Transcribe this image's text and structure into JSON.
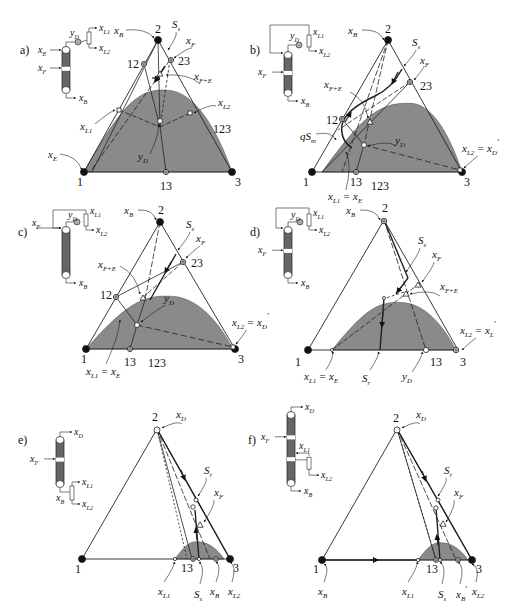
{
  "figure": {
    "panels": [
      {
        "id": "a",
        "label": "a)",
        "vertices": {
          "v1": "1",
          "v2": "2",
          "v3": "3"
        },
        "points": {
          "p12": "12",
          "p23": "23",
          "p13": "13",
          "p123": "123"
        },
        "annotations": [
          {
            "key": "xB",
            "base": "x",
            "sub": "B"
          },
          {
            "key": "Ss",
            "base": "S",
            "sub": "s"
          },
          {
            "key": "xF",
            "base": "x",
            "sub": "F"
          },
          {
            "key": "xFE",
            "base": "x",
            "sub": "F+E"
          },
          {
            "key": "xL2",
            "base": "x",
            "sub": "L2"
          },
          {
            "key": "xL1",
            "base": "x",
            "sub": "L1"
          },
          {
            "key": "yD",
            "base": "y",
            "sub": "D"
          },
          {
            "key": "xE",
            "base": "x",
            "sub": "E"
          }
        ],
        "column": {
          "streams": [
            {
              "key": "yD",
              "base": "y",
              "sub": "D"
            },
            {
              "key": "xL1",
              "base": "x",
              "sub": "L1"
            },
            {
              "key": "xL2",
              "base": "x",
              "sub": "L2"
            },
            {
              "key": "xE",
              "base": "x",
              "sub": "E"
            },
            {
              "key": "xF",
              "base": "x",
              "sub": "F"
            },
            {
              "key": "xB",
              "base": "x",
              "sub": "B"
            }
          ]
        }
      },
      {
        "id": "b",
        "label": "b)",
        "vertices": {
          "v1": "1",
          "v2": "2",
          "v3": "3"
        },
        "points": {
          "p12": "12",
          "p23": "23",
          "p13": "13",
          "p123": "123"
        },
        "annotations": [
          {
            "key": "xB",
            "base": "x",
            "sub": "B"
          },
          {
            "key": "Ss",
            "base": "S",
            "sub": "s"
          },
          {
            "key": "xF",
            "base": "x",
            "sub": "F"
          },
          {
            "key": "xFE",
            "base": "x",
            "sub": "F+E"
          },
          {
            "key": "qSm",
            "base": "qS",
            "sub": "m"
          },
          {
            "key": "yD",
            "base": "y",
            "sub": "D"
          },
          {
            "key": "xL1E",
            "base": "x",
            "sub": "L1",
            "suffix": " = x",
            "suffix_sub": "E"
          },
          {
            "key": "xL2D",
            "base": "x",
            "sub": "L2",
            "suffix": " = x",
            "suffix_sub": "D",
            "prime": "'"
          }
        ],
        "column": {
          "streams": [
            {
              "key": "yD",
              "base": "y",
              "sub": "D"
            },
            {
              "key": "xL1",
              "base": "x",
              "sub": "L1"
            },
            {
              "key": "xL2",
              "base": "x",
              "sub": "L2"
            },
            {
              "key": "xF",
              "base": "x",
              "sub": "F"
            },
            {
              "key": "xB",
              "base": "x",
              "sub": "B"
            }
          ]
        }
      },
      {
        "id": "c",
        "label": "c)",
        "vertices": {
          "v1": "1",
          "v2": "2",
          "v3": "3"
        },
        "points": {
          "p12": "12",
          "p23": "23",
          "p13": "13",
          "p123": "123"
        },
        "annotations": [
          {
            "key": "xB",
            "base": "x",
            "sub": "B"
          },
          {
            "key": "Ss",
            "base": "S",
            "sub": "s"
          },
          {
            "key": "xF",
            "base": "x",
            "sub": "F"
          },
          {
            "key": "xFE",
            "base": "x",
            "sub": "F+E"
          },
          {
            "key": "yD",
            "base": "y",
            "sub": "D"
          },
          {
            "key": "xL1E",
            "base": "x",
            "sub": "L1",
            "suffix": " = x",
            "suffix_sub": "E"
          },
          {
            "key": "xL2D",
            "base": "x",
            "sub": "L2",
            "suffix": " = x",
            "suffix_sub": "D",
            "prime": "'"
          }
        ],
        "column": {
          "streams": [
            {
              "key": "yD",
              "base": "y",
              "sub": "D"
            },
            {
              "key": "xL1",
              "base": "x",
              "sub": "L1"
            },
            {
              "key": "xL2",
              "base": "x",
              "sub": "L2"
            },
            {
              "key": "xF",
              "base": "x",
              "sub": "F"
            },
            {
              "key": "xB",
              "base": "x",
              "sub": "B"
            }
          ]
        }
      },
      {
        "id": "d",
        "label": "d)",
        "vertices": {
          "v1": "1",
          "v2": "2",
          "v3": "3"
        },
        "points": {
          "p13": "13"
        },
        "annotations": [
          {
            "key": "xB",
            "base": "x",
            "sub": "B"
          },
          {
            "key": "Ss",
            "base": "S",
            "sub": "s"
          },
          {
            "key": "xF",
            "base": "x",
            "sub": "F"
          },
          {
            "key": "xFE",
            "base": "x",
            "sub": "F+E"
          },
          {
            "key": "xL2L",
            "base": "x",
            "sub": "L2",
            "suffix": " = x",
            "suffix_sub": "L",
            "prime": "'"
          },
          {
            "key": "xL1E",
            "base": "x",
            "sub": "L1",
            "suffix": " = x",
            "suffix_sub": "E"
          },
          {
            "key": "Sr",
            "base": "S",
            "sub": "r"
          },
          {
            "key": "yD",
            "base": "y",
            "sub": "D"
          }
        ],
        "column": {
          "streams": [
            {
              "key": "yD",
              "base": "y",
              "sub": "D"
            },
            {
              "key": "xL1",
              "base": "x",
              "sub": "L1"
            },
            {
              "key": "xL2",
              "base": "x",
              "sub": "L2"
            },
            {
              "key": "xF",
              "base": "x",
              "sub": "F"
            },
            {
              "key": "xB",
              "base": "x",
              "sub": "B"
            }
          ]
        }
      },
      {
        "id": "e",
        "label": "e)",
        "vertices": {
          "v1": "1",
          "v2": "2",
          "v3": "3"
        },
        "points": {
          "p13": "13"
        },
        "annotations": [
          {
            "key": "xD",
            "base": "x",
            "sub": "D"
          },
          {
            "key": "Sr",
            "base": "S",
            "sub": "r"
          },
          {
            "key": "xF",
            "base": "x",
            "sub": "F"
          },
          {
            "key": "xL1",
            "base": "x",
            "sub": "L1"
          },
          {
            "key": "Ss",
            "base": "S",
            "sub": "s"
          },
          {
            "key": "xB",
            "base": "x",
            "sub": "B"
          },
          {
            "key": "xL2",
            "base": "x",
            "sub": "L2"
          }
        ],
        "column": {
          "streams": [
            {
              "key": "xD",
              "base": "x",
              "sub": "D"
            },
            {
              "key": "xF",
              "base": "x",
              "sub": "F"
            },
            {
              "key": "xL1",
              "base": "x",
              "sub": "L1"
            },
            {
              "key": "xB",
              "base": "x",
              "sub": "B"
            },
            {
              "key": "xL2",
              "base": "x",
              "sub": "L2"
            }
          ]
        }
      },
      {
        "id": "f",
        "label": "f)",
        "vertices": {
          "v1": "1",
          "v2": "2",
          "v3": "3"
        },
        "points": {
          "p13": "13"
        },
        "annotations": [
          {
            "key": "xD",
            "base": "x",
            "sub": "D"
          },
          {
            "key": "Sr",
            "base": "S",
            "sub": "r"
          },
          {
            "key": "xF",
            "base": "x",
            "sub": "F"
          },
          {
            "key": "xB1",
            "base": "x",
            "sub": "B"
          },
          {
            "key": "xL1",
            "base": "x",
            "sub": "L1"
          },
          {
            "key": "Ss",
            "base": "S",
            "sub": "s"
          },
          {
            "key": "xB",
            "base": "x",
            "sub": "B",
            "prime": "'"
          },
          {
            "key": "xL2",
            "base": "x",
            "sub": "L2"
          }
        ],
        "column": {
          "streams": [
            {
              "key": "xD",
              "base": "x",
              "sub": "D"
            },
            {
              "key": "xF",
              "base": "x",
              "sub": "F"
            },
            {
              "key": "xL1",
              "base": "x",
              "sub": "L1"
            },
            {
              "key": "xL2",
              "base": "x",
              "sub": "L2"
            },
            {
              "key": "xB",
              "base": "x",
              "sub": "B"
            }
          ]
        }
      }
    ],
    "colors": {
      "heterogeneous_region": "#8a8a8a",
      "line": "#222222",
      "background": "#ffffff"
    }
  }
}
